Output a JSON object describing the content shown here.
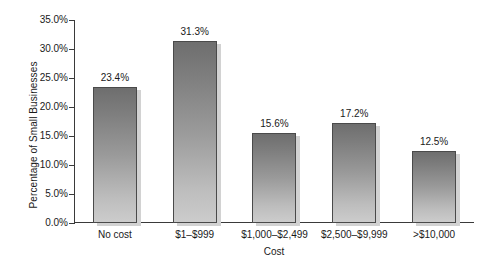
{
  "chart_data": {
    "type": "bar",
    "title": "",
    "subtitle": "",
    "xlabel": "Cost",
    "ylabel": "Percentage of Small Businesses",
    "categories": [
      "No cost",
      "$1–$999",
      "$1,000–$2,499",
      "$2,500–$9,999",
      ">$10,000"
    ],
    "values": [
      23.4,
      31.3,
      15.6,
      17.2,
      12.5
    ],
    "value_labels": [
      "23.4%",
      "31.3%",
      "15.6%",
      "17.2%",
      "12.5%"
    ],
    "ylim": [
      0,
      35
    ],
    "ytick_values": [
      0,
      5,
      10,
      15,
      20,
      25,
      30,
      35
    ],
    "ytick_labels": [
      "0.0%",
      "5.0%",
      "10.0%",
      "15.0%",
      "20.0%",
      "25.0%",
      "30.0%",
      "35.0%"
    ],
    "grid": false,
    "legend": null,
    "legend_position": "none",
    "colors": {
      "bar_gradient_top": "#6e6e6e",
      "bar_gradient_bottom": "#cccccc",
      "bar_border": "#4a4a4a",
      "bar_shadow": "#d2d2d2",
      "axis": "#3a3a3a",
      "text": "#1a1a1a",
      "background": "#ffffff"
    }
  }
}
